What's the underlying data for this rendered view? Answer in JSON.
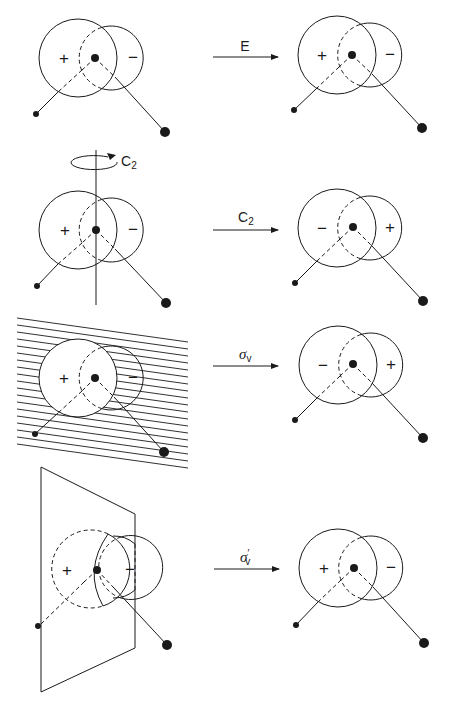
{
  "figure": {
    "rows": [
      {
        "operation": "E",
        "operation_sub": "",
        "before": {
          "left_lobe": "+",
          "right_lobe": "−"
        },
        "after": {
          "left_lobe": "+",
          "right_lobe": "−"
        }
      },
      {
        "operation": "C",
        "operation_sub": "2",
        "before": {
          "left_lobe": "+",
          "right_lobe": "−"
        },
        "after": {
          "left_lobe": "−",
          "right_lobe": "+"
        },
        "axis_label": "C",
        "axis_label_sub": "2"
      },
      {
        "operation": "σ",
        "operation_sub": "v",
        "before": {
          "left_lobe": "+",
          "right_lobe": "−"
        },
        "after": {
          "left_lobe": "−",
          "right_lobe": "+"
        }
      },
      {
        "operation": "σ",
        "operation_sub": "v",
        "operation_prime": "′",
        "before": {
          "left_lobe": "+",
          "right_lobe": "−"
        },
        "after": {
          "left_lobe": "+",
          "right_lobe": "−"
        }
      }
    ]
  },
  "colors": {
    "ink": "#1a1a1a",
    "background": "#ffffff"
  }
}
